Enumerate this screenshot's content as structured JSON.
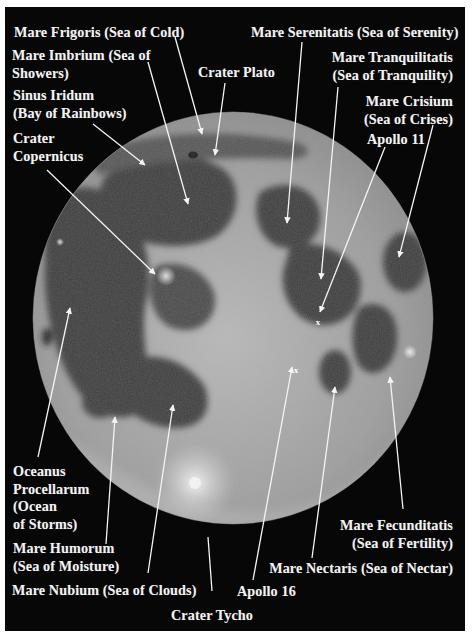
{
  "figure": {
    "background_color": "#070707",
    "label_color": "#f2f2f2"
  },
  "labels": [
    {
      "id": "mare-frigoris",
      "lines": [
        "Mare Frigoris (Sea of Cold)"
      ]
    },
    {
      "id": "mare-imbrium",
      "lines": [
        "Mare Imbrium (Sea of",
        "Showers)"
      ]
    },
    {
      "id": "crater-plato",
      "lines": [
        "Crater Plato"
      ]
    },
    {
      "id": "sinus-iridum",
      "lines": [
        "Sinus Iridum",
        "(Bay of Rainbows)"
      ]
    },
    {
      "id": "crater-copernicus",
      "lines": [
        "Crater",
        "Copernicus"
      ]
    },
    {
      "id": "mare-serenitatis",
      "lines": [
        "Mare Serenitatis (Sea of Serenity)"
      ]
    },
    {
      "id": "mare-tranquilitatis",
      "lines": [
        "Mare Tranquilitatis",
        "(Sea of Tranquility)"
      ]
    },
    {
      "id": "mare-crisium",
      "lines": [
        "Mare Crisium",
        "(Sea of Crises)"
      ]
    },
    {
      "id": "apollo-11",
      "lines": [
        "Apollo 11"
      ]
    },
    {
      "id": "oceanus-procellarum",
      "lines": [
        "Oceanus",
        "Procellarum",
        "(Ocean",
        "of Storms)"
      ]
    },
    {
      "id": "mare-humorum",
      "lines": [
        "Mare Humorum",
        "(Sea of Moisture)"
      ]
    },
    {
      "id": "mare-nubium",
      "lines": [
        "Mare Nubium (Sea of Clouds)"
      ]
    },
    {
      "id": "crater-tycho",
      "lines": [
        "Crater Tycho"
      ]
    },
    {
      "id": "apollo-16",
      "lines": [
        "Apollo 16"
      ]
    },
    {
      "id": "mare-nectaris",
      "lines": [
        "Mare Nectaris (Sea of Nectar)"
      ]
    },
    {
      "id": "mare-fecunditatis",
      "lines": [
        "Mare Fecunditatis",
        "(Sea of Fertility)"
      ]
    }
  ],
  "markers": {
    "apollo_11": "x",
    "apollo_16": "x"
  }
}
